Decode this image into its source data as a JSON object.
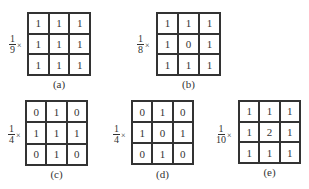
{
  "panels": [
    {
      "id": "a",
      "caption": "(a)",
      "factor_num": "1",
      "factor_den": "9",
      "times": "×",
      "matrix": [
        [
          "1",
          "1",
          "1"
        ],
        [
          "1",
          "1",
          "1"
        ],
        [
          "1",
          "1",
          "1"
        ]
      ]
    },
    {
      "id": "b",
      "caption": "(b)",
      "factor_num": "1",
      "factor_den": "8",
      "times": "×",
      "matrix": [
        [
          "1",
          "1",
          "1"
        ],
        [
          "1",
          "0",
          "1"
        ],
        [
          "1",
          "1",
          "1"
        ]
      ]
    },
    {
      "id": "c",
      "caption": "(c)",
      "factor_num": "1",
      "factor_den": "4",
      "times": "×",
      "matrix": [
        [
          "0",
          "1",
          "0"
        ],
        [
          "1",
          "1",
          "1"
        ],
        [
          "0",
          "1",
          "0"
        ]
      ]
    },
    {
      "id": "d",
      "caption": "(d)",
      "factor_num": "1",
      "factor_den": "4",
      "times": "×",
      "matrix": [
        [
          "0",
          "1",
          "0"
        ],
        [
          "1",
          "0",
          "1"
        ],
        [
          "0",
          "1",
          "0"
        ]
      ]
    },
    {
      "id": "e",
      "caption": "(e)",
      "factor_num": "1",
      "factor_den": "10",
      "times": "×",
      "matrix": [
        [
          "1",
          "1",
          "1"
        ],
        [
          "1",
          "2",
          "1"
        ],
        [
          "1",
          "1",
          "1"
        ]
      ]
    }
  ]
}
